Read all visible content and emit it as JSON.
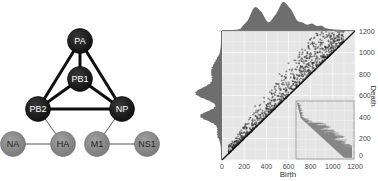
{
  "network": {
    "core_nodes": [
      {
        "id": "PA",
        "label": "PA",
        "x": 80,
        "y": 41
      },
      {
        "id": "PB1",
        "label": "PB1",
        "x": 80,
        "y": 79
      },
      {
        "id": "PB2",
        "label": "PB2",
        "x": 38,
        "y": 109
      },
      {
        "id": "NP",
        "label": "NP",
        "x": 122,
        "y": 109
      }
    ],
    "peripheral_nodes": [
      {
        "id": "NA",
        "label": "NA",
        "x": 13,
        "y": 144
      },
      {
        "id": "HA",
        "label": "HA",
        "x": 63,
        "y": 144
      },
      {
        "id": "M1",
        "label": "M1",
        "x": 97,
        "y": 144
      },
      {
        "id": "NS1",
        "label": "NS1",
        "x": 147,
        "y": 144
      }
    ],
    "strong_edges": [
      [
        "PA",
        "PB1"
      ],
      [
        "PA",
        "PB2"
      ],
      [
        "PA",
        "NP"
      ],
      [
        "PB1",
        "PB2"
      ],
      [
        "PB1",
        "NP"
      ],
      [
        "PB2",
        "NP"
      ]
    ],
    "weak_edges": [
      [
        "PB2",
        "HA"
      ],
      [
        "NA",
        "HA"
      ],
      [
        "NP",
        "M1"
      ],
      [
        "M1",
        "NS1"
      ]
    ],
    "colors": {
      "core": "#1a1a1a",
      "peripheral": "#8c8c8c",
      "label": "#ffffff",
      "peripheral_label": "#1e1e1e"
    }
  },
  "plot": {
    "xlabel": "Birth",
    "ylabel": "Death",
    "x_ticks": [
      "0",
      "200",
      "400",
      "600",
      "800",
      "1000",
      "1200"
    ],
    "y_ticks": [
      "0",
      "200",
      "400",
      "600",
      "800",
      "1000",
      "1200"
    ],
    "colors": {
      "panel_bg": "#e6e6e6",
      "grid": "#f7f7f7",
      "points": "#2a2a2a",
      "marginal": "#555555"
    }
  },
  "chart_data": {
    "type": "scatter",
    "title": "",
    "xlabel": "Birth",
    "ylabel": "Death",
    "xlim": [
      0,
      1200
    ],
    "ylim": [
      0,
      1200
    ],
    "grid": true,
    "diagonal_line": true,
    "x_ticks": [
      0,
      200,
      400,
      600,
      800,
      1000,
      1200
    ],
    "y_ticks": [
      0,
      200,
      400,
      600,
      800,
      1000,
      1200
    ],
    "marginal_top": {
      "type": "histogram",
      "peaks_at": [
        310,
        560
      ],
      "range": [
        0,
        1100
      ]
    },
    "marginal_left": {
      "type": "histogram",
      "peaks_at": [
        410,
        620
      ],
      "range": [
        0,
        1100
      ]
    },
    "inset": {
      "type": "barcode",
      "description": "persistence barcode inset in lower right"
    },
    "points_description": "Dense point cloud above diagonal, concentrated near line; spread increases with birth up to ~1100",
    "sample_points": [
      [
        100,
        130
      ],
      [
        150,
        180
      ],
      [
        200,
        260
      ],
      [
        250,
        300
      ],
      [
        280,
        360
      ],
      [
        300,
        330
      ],
      [
        330,
        420
      ],
      [
        350,
        400
      ],
      [
        380,
        440
      ],
      [
        400,
        480
      ],
      [
        420,
        520
      ],
      [
        450,
        500
      ],
      [
        470,
        560
      ],
      [
        500,
        560
      ],
      [
        520,
        620
      ],
      [
        540,
        600
      ],
      [
        560,
        700
      ],
      [
        580,
        650
      ],
      [
        600,
        720
      ],
      [
        620,
        680
      ],
      [
        640,
        800
      ],
      [
        660,
        720
      ],
      [
        680,
        760
      ],
      [
        700,
        840
      ],
      [
        720,
        780
      ],
      [
        740,
        900
      ],
      [
        760,
        820
      ],
      [
        780,
        860
      ],
      [
        800,
        960
      ],
      [
        820,
        880
      ],
      [
        840,
        920
      ],
      [
        860,
        1000
      ],
      [
        880,
        940
      ],
      [
        900,
        1080
      ],
      [
        920,
        980
      ],
      [
        950,
        1040
      ],
      [
        980,
        1100
      ],
      [
        1000,
        1060
      ],
      [
        1030,
        1140
      ],
      [
        1060,
        1120
      ],
      [
        450,
        650
      ],
      [
        520,
        800
      ],
      [
        600,
        900
      ],
      [
        700,
        1000
      ],
      [
        780,
        1060
      ],
      [
        860,
        1160
      ],
      [
        300,
        500
      ],
      [
        380,
        580
      ]
    ]
  }
}
